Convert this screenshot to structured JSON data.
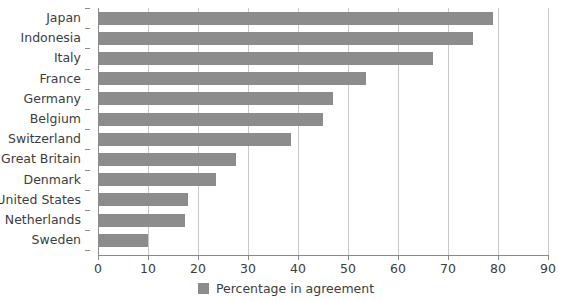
{
  "chart_data": {
    "type": "bar",
    "orientation": "horizontal",
    "title": "",
    "xlabel": "",
    "ylabel": "",
    "xlim": [
      0,
      90
    ],
    "xticks": [
      0,
      10,
      20,
      30,
      40,
      50,
      60,
      70,
      80,
      90
    ],
    "grid": true,
    "legend_position": "bottom-center",
    "categories": [
      "Japan",
      "Indonesia",
      "Italy",
      "France",
      "Germany",
      "Belgium",
      "Switzerland",
      "Great Britain",
      "Denmark",
      "United States",
      "Netherlands",
      "Sweden"
    ],
    "values": [
      79,
      75,
      67,
      53.5,
      47,
      45,
      38.5,
      27.5,
      23.5,
      18,
      17.3,
      10
    ],
    "series": [
      {
        "name": "Percentage in agreement",
        "color": "#8c8c8c",
        "values": [
          79,
          75,
          67,
          53.5,
          47,
          45,
          38.5,
          27.5,
          23.5,
          18,
          17.3,
          10
        ]
      }
    ],
    "legend": [
      {
        "label": "Percentage in agreement",
        "color": "#8c8c8c"
      }
    ]
  },
  "style": {
    "bar_color": "#8c8c8c",
    "grid_color": "#c8c8c8",
    "axis_color": "#8a8a8a",
    "text_color": "#3d3d3d",
    "background": "#ffffff"
  }
}
